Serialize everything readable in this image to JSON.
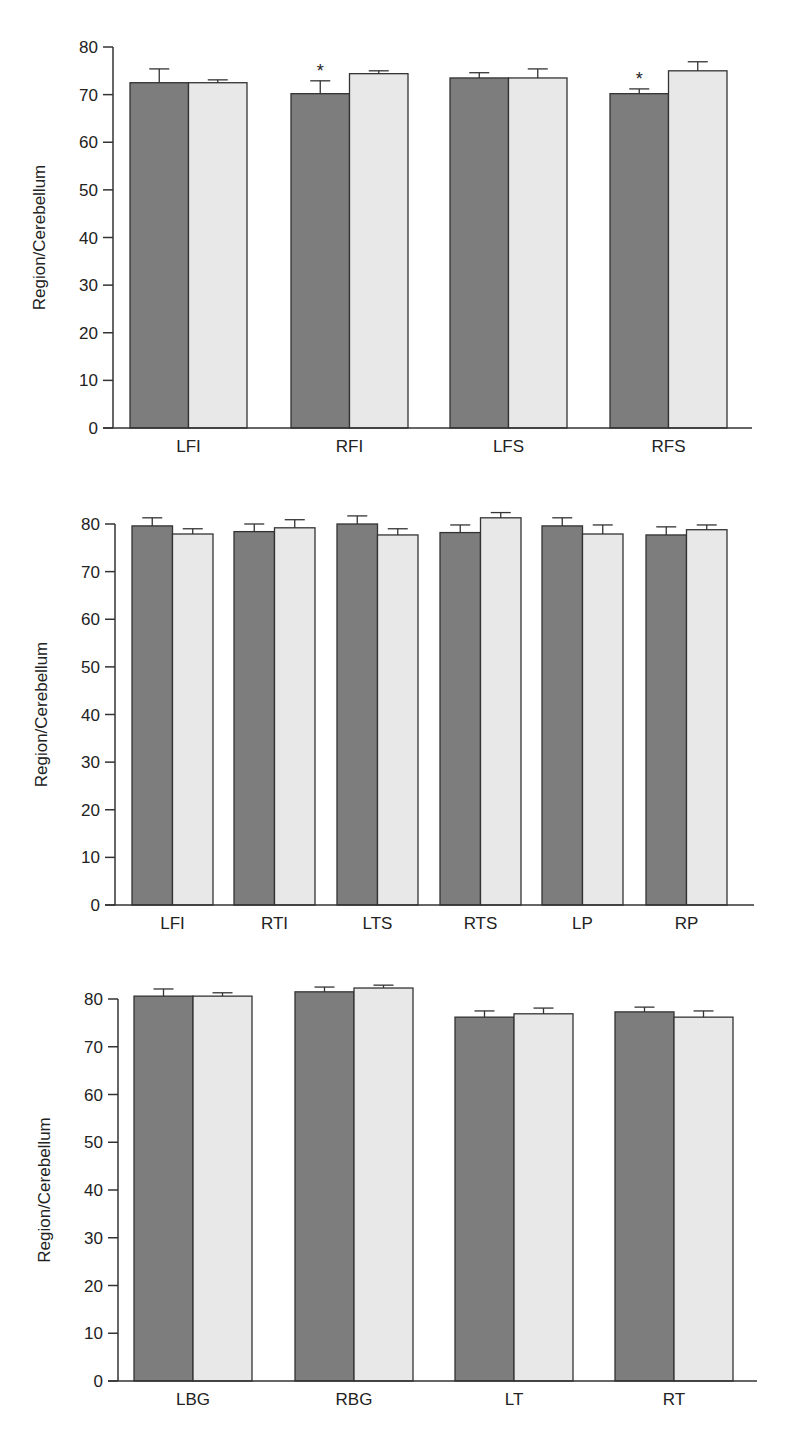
{
  "colors": {
    "series_a": "#7d7d7d",
    "series_b": "#e8e8e8",
    "axis": "#333333",
    "text": "#222222",
    "asterisk": "#666666"
  },
  "chart_data": [
    {
      "type": "bar",
      "title": "",
      "xlabel": "",
      "ylabel": "Region/Cerebellum",
      "ylim": [
        0,
        80
      ],
      "yticks": [
        0,
        10,
        20,
        30,
        40,
        50,
        60,
        70,
        80
      ],
      "grid": false,
      "legend": null,
      "categories": [
        "LFI",
        "RFI",
        "LFS",
        "RFS"
      ],
      "series": [
        {
          "name": "Group 1 (dark)",
          "values": [
            72.5,
            70.2,
            73.5,
            70.2
          ],
          "error": [
            2.9,
            2.7,
            1.1,
            1.0
          ]
        },
        {
          "name": "Group 2 (light)",
          "values": [
            72.5,
            74.4,
            73.5,
            75.0
          ],
          "error": [
            0.6,
            0.6,
            1.9,
            1.9
          ]
        }
      ],
      "annotations": [
        {
          "text": "*",
          "category": "RFI",
          "series": 0
        },
        {
          "text": "*",
          "category": "RFS",
          "series": 0
        }
      ]
    },
    {
      "type": "bar",
      "title": "",
      "xlabel": "",
      "ylabel": "Region/Cerebellum",
      "ylim": [
        0,
        80
      ],
      "yticks": [
        0,
        10,
        20,
        30,
        40,
        50,
        60,
        70,
        80
      ],
      "grid": false,
      "legend": null,
      "categories": [
        "LFI",
        "RTI",
        "LTS",
        "RTS",
        "LP",
        "RP"
      ],
      "series": [
        {
          "name": "Group 1 (dark)",
          "values": [
            79.6,
            78.4,
            80.0,
            78.2,
            79.6,
            77.7
          ],
          "error": [
            1.7,
            1.6,
            1.7,
            1.6,
            1.7,
            1.7
          ]
        },
        {
          "name": "Group 2 (light)",
          "values": [
            77.9,
            79.2,
            77.7,
            81.3,
            77.9,
            78.8
          ],
          "error": [
            1.1,
            1.7,
            1.3,
            1.1,
            1.9,
            1.0
          ]
        }
      ],
      "annotations": []
    },
    {
      "type": "bar",
      "title": "",
      "xlabel": "",
      "ylabel": "Region/Cerebellum",
      "ylim": [
        0,
        80
      ],
      "yticks": [
        0,
        10,
        20,
        30,
        40,
        50,
        60,
        70,
        80
      ],
      "grid": false,
      "legend": null,
      "categories": [
        "LBG",
        "RBG",
        "LT",
        "RT"
      ],
      "series": [
        {
          "name": "Group 1 (dark)",
          "values": [
            80.6,
            81.5,
            76.2,
            77.3
          ],
          "error": [
            1.5,
            1.0,
            1.3,
            1.0
          ]
        },
        {
          "name": "Group 2 (light)",
          "values": [
            80.6,
            82.3,
            76.9,
            76.2
          ],
          "error": [
            0.7,
            0.6,
            1.2,
            1.3
          ]
        }
      ],
      "annotations": []
    }
  ],
  "layout": [
    {
      "top": 0,
      "height": 470,
      "axis_x": 113,
      "y0": 428,
      "y80": 47,
      "x_end": 752,
      "bar_starts": [
        130,
        291,
        450,
        610
      ],
      "bar_w": 58.5,
      "ylabel_x": 45,
      "label_y": 452
    },
    {
      "top": 470,
      "height": 500,
      "axis_x": 115,
      "y0": 435,
      "y80": 54,
      "x_end": 754,
      "bar_starts": [
        132,
        234,
        337,
        440,
        542,
        646
      ],
      "bar_w": 40.5,
      "ylabel_x": 47,
      "label_y": 459
    },
    {
      "top": 970,
      "height": 462,
      "axis_x": 118,
      "y0": 411,
      "y80": 29,
      "x_end": 757,
      "bar_starts": [
        134,
        295,
        455,
        615
      ],
      "bar_w": 59,
      "ylabel_x": 50,
      "label_y": 435
    }
  ]
}
